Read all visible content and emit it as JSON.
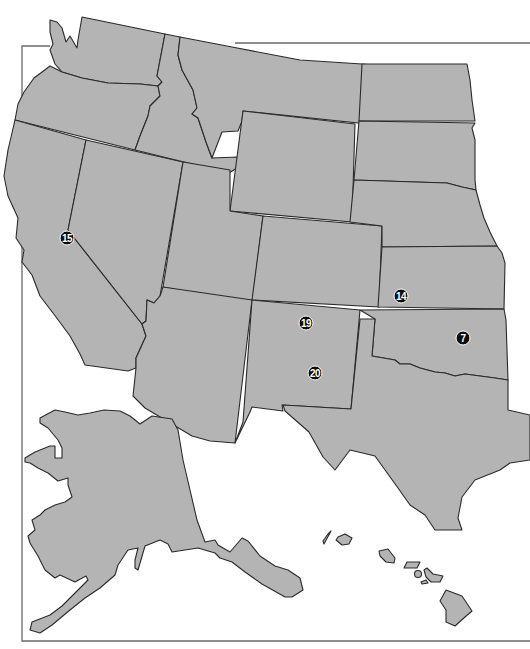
{
  "map": {
    "title": "",
    "region": "Western United States with Alaska and Hawaii insets",
    "colors": {
      "land": "#b4b4b4",
      "border": "#2a2a2a",
      "background": "#ffffff",
      "marker_fill": "#0d0d0d",
      "marker_text": "#ffffff",
      "frame": "#6a6a6a"
    },
    "markers": [
      {
        "id": "m15",
        "label": "15",
        "x": 67,
        "y": 238,
        "state": "California"
      },
      {
        "id": "m14",
        "label": "14",
        "x": 401,
        "y": 296,
        "state": "Kansas"
      },
      {
        "id": "m7",
        "label": "7",
        "x": 463,
        "y": 338,
        "state": "Oklahoma"
      },
      {
        "id": "m19",
        "label": "19",
        "x": 306,
        "y": 323,
        "state": "New Mexico"
      },
      {
        "id": "m20",
        "label": "20",
        "x": 315,
        "y": 373,
        "state": "New Mexico"
      }
    ]
  }
}
